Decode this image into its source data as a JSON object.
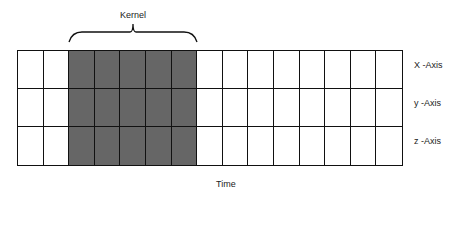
{
  "diagram": {
    "kernel_label": "Kernel",
    "time_label": "Time",
    "rows": [
      {
        "label": "X -Axis"
      },
      {
        "label": "y -Axis"
      },
      {
        "label": "z -Axis"
      }
    ],
    "columns": 15,
    "kernel_columns": [
      2,
      3,
      4,
      5,
      6
    ],
    "colors": {
      "kernel_fill": "#666666",
      "cell_fill": "#ffffff",
      "line": "#111111"
    }
  }
}
